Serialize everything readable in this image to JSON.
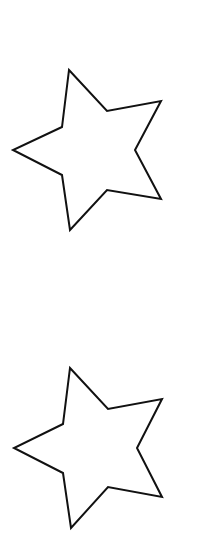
{
  "canvas": {
    "width": 216,
    "height": 544,
    "background": "#ffffff"
  },
  "stroke_color": "#111111",
  "stroke_width": 2,
  "shapes": [
    {
      "type": "star",
      "points": "69,70 107,111 161,101 135,150 161,199 107,190 70,230 62,175 13,150 62,127"
    },
    {
      "type": "star",
      "points": "70,368 108,409 162,399 137,448 162,497 108,487 71,528 63,473 14,448 63,424"
    }
  ]
}
